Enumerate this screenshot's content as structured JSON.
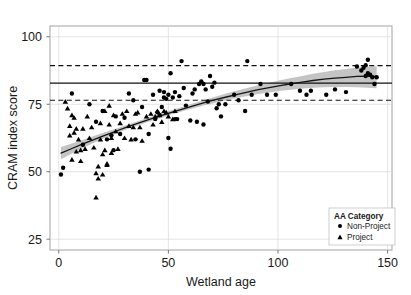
{
  "chart_data": {
    "type": "scatter",
    "title": "",
    "xlabel": "Wetland age",
    "ylabel": "CRAM index score",
    "xlim": [
      -4,
      152
    ],
    "ylim": [
      21,
      104
    ],
    "xticks": [
      0,
      50,
      100,
      150
    ],
    "xtick_labels": [
      "0",
      "50",
      "100",
      "150"
    ],
    "yticks": [
      25,
      50,
      75,
      100
    ],
    "ytick_labels": [
      "25",
      "50",
      "75",
      "100"
    ],
    "grid": true,
    "legend": {
      "title": "AA Category",
      "position": "bottom-right",
      "entries": [
        {
          "label": "Non-Project",
          "marker": "circle"
        },
        {
          "label": "Project",
          "marker": "triangle"
        }
      ]
    },
    "reference_lines": [
      {
        "value": 82.8,
        "style": "solid",
        "name": "mean-reference-line"
      },
      {
        "value": 89.3,
        "style": "dashed",
        "name": "upper-reference-line"
      },
      {
        "value": 76.5,
        "style": "dashed",
        "name": "lower-reference-line"
      }
    ],
    "fit_curve": {
      "name": "loess-fit",
      "x": [
        1,
        6,
        11,
        16,
        21,
        26,
        31,
        36,
        41,
        46,
        51,
        56,
        61,
        66,
        71,
        76,
        81,
        86,
        91,
        96,
        101,
        106,
        111,
        116,
        121,
        126,
        131,
        136,
        141,
        145
      ],
      "y": [
        56.9,
        58.6,
        60.3,
        61.9,
        63.5,
        65.0,
        66.5,
        67.9,
        69.3,
        70.6,
        71.9,
        73.1,
        74.3,
        75.5,
        76.6,
        77.6,
        78.6,
        79.5,
        80.4,
        81.2,
        81.9,
        82.6,
        83.2,
        83.8,
        84.3,
        84.7,
        85.0,
        85.3,
        85.4,
        85.3
      ],
      "ci_lower": [
        54.6,
        56.8,
        58.8,
        60.7,
        62.5,
        64.1,
        65.7,
        67.1,
        68.5,
        69.8,
        71.1,
        72.3,
        73.4,
        74.5,
        75.5,
        76.4,
        77.3,
        78.1,
        78.8,
        79.4,
        80.0,
        80.4,
        80.8,
        81.1,
        81.3,
        81.4,
        81.4,
        81.3,
        81.1,
        80.9
      ],
      "ci_upper": [
        59.2,
        60.5,
        61.8,
        63.2,
        64.6,
        65.9,
        67.3,
        68.7,
        70.1,
        71.4,
        72.7,
        73.9,
        75.2,
        76.5,
        77.7,
        78.9,
        80.0,
        81.0,
        82.0,
        83.0,
        83.9,
        84.7,
        85.5,
        86.3,
        87.0,
        87.6,
        88.1,
        88.6,
        88.9,
        89.1
      ]
    },
    "series": [
      {
        "name": "Non-Project",
        "marker": "circle",
        "color": "#000000",
        "points": [
          [
            1,
            49.0
          ],
          [
            2,
            51.5
          ],
          [
            6,
            79.0
          ],
          [
            11,
            60.0
          ],
          [
            14,
            75.0
          ],
          [
            17,
            68.5
          ],
          [
            20,
            72.5
          ],
          [
            22,
            62.0
          ],
          [
            24,
            63.5
          ],
          [
            25,
            58.0
          ],
          [
            26,
            70.5
          ],
          [
            28,
            64.0
          ],
          [
            30,
            70.0
          ],
          [
            32,
            79.0
          ],
          [
            34,
            76.5
          ],
          [
            35,
            62.0
          ],
          [
            37,
            50.0
          ],
          [
            38,
            74.0
          ],
          [
            39,
            84.0
          ],
          [
            40,
            84.0
          ],
          [
            41,
            50.8
          ],
          [
            41,
            64.0
          ],
          [
            43,
            78.5
          ],
          [
            44,
            69.5
          ],
          [
            45,
            72.0
          ],
          [
            46,
            71.0
          ],
          [
            46,
            80.0
          ],
          [
            47,
            74.0
          ],
          [
            48,
            77.5
          ],
          [
            48,
            79.5
          ],
          [
            49,
            77.0
          ],
          [
            50,
            78.5
          ],
          [
            50,
            62.5
          ],
          [
            51,
            86.5
          ],
          [
            51,
            58.5
          ],
          [
            52,
            77.5
          ],
          [
            53,
            79.5
          ],
          [
            53,
            69.5
          ],
          [
            54,
            69.5
          ],
          [
            55,
            78.0
          ],
          [
            56,
            91.0
          ],
          [
            57,
            81.0
          ],
          [
            58,
            74.5
          ],
          [
            60,
            69.0
          ],
          [
            61,
            79.0
          ],
          [
            62,
            80.5
          ],
          [
            63,
            68.5
          ],
          [
            64,
            82.5
          ],
          [
            65,
            83.5
          ],
          [
            66,
            82.5
          ],
          [
            66,
            67.5
          ],
          [
            67,
            80.5
          ],
          [
            68,
            76.0
          ],
          [
            69,
            85.5
          ],
          [
            70,
            81.5
          ],
          [
            71,
            83.0
          ],
          [
            72,
            73.5
          ],
          [
            73,
            75.0
          ],
          [
            74,
            70.5
          ],
          [
            76,
            75.0
          ],
          [
            80,
            78.5
          ],
          [
            82,
            76.5
          ],
          [
            85,
            72.5
          ],
          [
            86,
            91.0
          ],
          [
            88,
            78.5
          ],
          [
            92,
            82.5
          ],
          [
            95,
            78.5
          ],
          [
            99,
            78.5
          ],
          [
            106,
            82.5
          ],
          [
            110,
            80.0
          ],
          [
            113,
            78.5
          ],
          [
            115,
            80.0
          ],
          [
            122,
            78.5
          ],
          [
            126,
            80.5
          ],
          [
            131,
            79.5
          ],
          [
            136,
            89.0
          ],
          [
            138,
            87.5
          ],
          [
            139,
            88.5
          ],
          [
            140,
            89.5
          ],
          [
            140,
            85.5
          ],
          [
            141,
            91.5
          ],
          [
            141,
            86.5
          ],
          [
            142,
            86.0
          ],
          [
            143,
            85.0
          ],
          [
            144,
            82.5
          ],
          [
            145,
            85.0
          ]
        ]
      },
      {
        "name": "Project",
        "marker": "triangle",
        "color": "#000000",
        "points": [
          [
            3,
            76.0
          ],
          [
            4,
            73.5
          ],
          [
            5,
            67.0
          ],
          [
            5,
            63.5
          ],
          [
            6,
            71.0
          ],
          [
            6,
            54.5
          ],
          [
            7,
            70.0
          ],
          [
            7,
            64.5
          ],
          [
            8,
            66.0
          ],
          [
            8,
            57.5
          ],
          [
            9,
            62.0
          ],
          [
            10,
            58.0
          ],
          [
            10,
            54.0
          ],
          [
            11,
            66.0
          ],
          [
            12,
            58.5
          ],
          [
            13,
            70.5
          ],
          [
            14,
            62.5
          ],
          [
            15,
            66.5
          ],
          [
            16,
            59.0
          ],
          [
            17,
            40.5
          ],
          [
            17,
            49.5
          ],
          [
            18,
            47.5
          ],
          [
            18,
            52.0
          ],
          [
            19,
            68.0
          ],
          [
            19,
            62.0
          ],
          [
            20,
            49.0
          ],
          [
            20,
            56.5
          ],
          [
            21,
            72.5
          ],
          [
            21,
            58.0
          ],
          [
            22,
            53.0
          ],
          [
            22,
            52.5
          ],
          [
            23,
            74.5
          ],
          [
            23,
            67.5
          ],
          [
            24,
            57.0
          ],
          [
            24,
            62.5
          ],
          [
            25,
            71.0
          ],
          [
            26,
            65.0
          ],
          [
            27,
            58.5
          ],
          [
            28,
            68.0
          ],
          [
            29,
            71.5
          ],
          [
            30,
            62.5
          ],
          [
            31,
            72.5
          ],
          [
            32,
            67.0
          ],
          [
            33,
            62.0
          ],
          [
            34,
            66.5
          ],
          [
            35,
            71.5
          ],
          [
            36,
            72.0
          ],
          [
            37,
            66.5
          ],
          [
            38,
            61.5
          ],
          [
            40,
            70.5
          ],
          [
            42,
            71.5
          ],
          [
            43,
            67.5
          ],
          [
            44,
            70.5
          ],
          [
            45,
            72.5
          ],
          [
            46,
            71.0
          ],
          [
            47,
            68.5
          ],
          [
            48,
            72.5
          ],
          [
            49,
            72.0
          ],
          [
            50,
            70.5
          ],
          [
            52,
            69.5
          ],
          [
            53,
            72.5
          ]
        ]
      }
    ]
  }
}
